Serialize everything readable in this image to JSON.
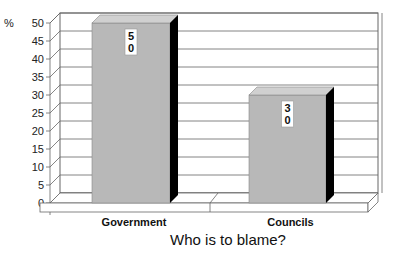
{
  "chart_data": {
    "type": "bar",
    "title": "",
    "xlabel": "Who is to blame?",
    "ylabel": "%",
    "categories": [
      "Government",
      "Councils"
    ],
    "values": [
      50,
      30
    ],
    "data_labels": [
      "5\n0",
      "3\n0"
    ],
    "ylim": [
      0,
      50
    ],
    "yticks": [
      0,
      5,
      10,
      15,
      20,
      25,
      30,
      35,
      40,
      45,
      50
    ],
    "grid": true,
    "legend": null,
    "style": "3d"
  },
  "labels": {
    "y_unit": "%",
    "x_title": "Who is to blame?",
    "cat0": "Government",
    "cat1": "Councils"
  },
  "colors": {
    "bar_face": "#b8b8b8",
    "bar_top": "#d0d0d0",
    "bar_side": "#000000",
    "grid": "#666666"
  }
}
